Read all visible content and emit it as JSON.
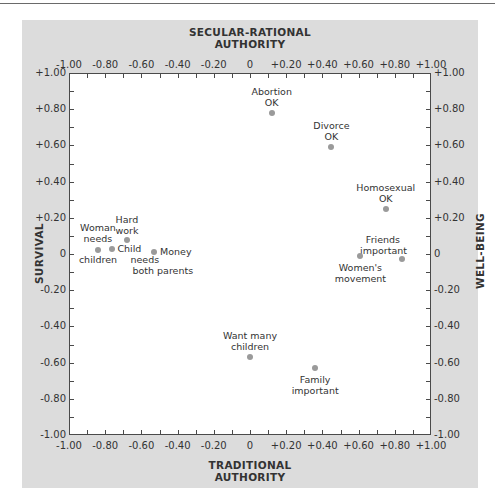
{
  "chart_data": {
    "type": "scatter",
    "title": "",
    "axes": {
      "top_label": [
        "SECULAR-RATIONAL",
        "AUTHORITY"
      ],
      "bottom_label": [
        "TRADITIONAL",
        "AUTHORITY"
      ],
      "left_label": "SURVIVAL",
      "right_label": "WELL-BEING",
      "x_ticks": [
        "-1.00",
        "-0.80",
        "-0.60",
        "-0.40",
        "-0.20",
        "0",
        "+0.20",
        "+0.40",
        "+0.60",
        "+0.80",
        "+1.00"
      ],
      "y_ticks": [
        "+1.00",
        "+0.80",
        "+0.60",
        "+0.40",
        "+0.20",
        "0",
        "-0.20",
        "-0.40",
        "-0.60",
        "-0.80",
        "-1.00"
      ],
      "xlim": [
        -1.0,
        1.0
      ],
      "ylim": [
        -1.0,
        1.0
      ]
    },
    "grid": false,
    "points": [
      {
        "label": "Abortion OK",
        "lines": [
          "Abortion",
          "OK"
        ],
        "x": 0.12,
        "y": 0.78
      },
      {
        "label": "Divorce OK",
        "lines": [
          "Divorce",
          "OK"
        ],
        "x": 0.45,
        "y": 0.59
      },
      {
        "label": "Homosexual OK",
        "lines": [
          "Homosexual",
          "OK"
        ],
        "x": 0.75,
        "y": 0.25
      },
      {
        "label": "Friends important",
        "lines": [
          "Friends",
          "important"
        ],
        "x": 0.84,
        "y": -0.03
      },
      {
        "label": "Women's movement",
        "lines": [
          "Women's",
          "movement"
        ],
        "x": 0.61,
        "y": -0.01
      },
      {
        "label": "Hard work",
        "lines": [
          "Hard",
          "work"
        ],
        "x": -0.68,
        "y": 0.08
      },
      {
        "label": "Woman needs children",
        "lines": [
          "Woman",
          "needs",
          "children"
        ],
        "x": -0.84,
        "y": 0.02
      },
      {
        "label": "Child needs both parents",
        "lines": [
          "Child",
          "needs",
          "both parents"
        ],
        "x": -0.76,
        "y": 0.03
      },
      {
        "label": "Money",
        "lines": [
          "Money"
        ],
        "x": -0.53,
        "y": 0.01
      },
      {
        "label": "Want many children",
        "lines": [
          "Want many",
          "children"
        ],
        "x": 0.0,
        "y": -0.57
      },
      {
        "label": "Family important",
        "lines": [
          "Family",
          "important"
        ],
        "x": 0.36,
        "y": -0.63
      }
    ]
  }
}
